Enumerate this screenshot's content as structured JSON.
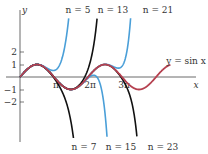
{
  "chart_data": {
    "type": "line",
    "title": "",
    "xlabel": "x",
    "ylabel": "y",
    "x_ticks": [
      {
        "value": 3.14159,
        "label": "π"
      },
      {
        "value": 6.28319,
        "label": "2π"
      },
      {
        "value": 9.42478,
        "label": "3π"
      }
    ],
    "y_ticks": [
      {
        "value": 2,
        "label": "2"
      },
      {
        "value": 1,
        "label": "1"
      },
      {
        "value": -1,
        "label": "−1"
      },
      {
        "value": -2,
        "label": "−2"
      }
    ],
    "xlim": [
      0,
      17
    ],
    "ylim": [
      -4.9,
      4.9
    ],
    "grid": false,
    "series": [
      {
        "name": "y = sin x",
        "kind": "sine",
        "color": "#b5404f",
        "x_range": [
          0,
          13.9
        ]
      },
      {
        "name": "n = 5",
        "kind": "taylor",
        "n": 5,
        "color": "#4a9fd8",
        "label_pos": "top"
      },
      {
        "name": "n = 7",
        "kind": "taylor",
        "n": 7,
        "color": "#111111",
        "label_pos": "bottom"
      },
      {
        "name": "n = 13",
        "kind": "taylor",
        "n": 13,
        "color": "#111111",
        "label_pos": "top"
      },
      {
        "name": "n = 15",
        "kind": "taylor",
        "n": 15,
        "color": "#4a9fd8",
        "label_pos": "bottom"
      },
      {
        "name": "n = 21",
        "kind": "taylor",
        "n": 21,
        "color": "#4a9fd8",
        "label_pos": "top"
      },
      {
        "name": "n = 23",
        "kind": "taylor",
        "n": 23,
        "color": "#111111",
        "label_pos": "bottom"
      }
    ],
    "annotations": [
      {
        "text": "n = 5",
        "x": 78,
        "y": 13
      },
      {
        "text": "n = 13",
        "x": 113,
        "y": 13
      },
      {
        "text": "n = 21",
        "x": 158,
        "y": 13
      },
      {
        "text": "n = 7",
        "x": 84,
        "y": 150
      },
      {
        "text": "n = 15",
        "x": 121,
        "y": 150
      },
      {
        "text": "n = 23",
        "x": 163,
        "y": 150
      },
      {
        "text": "y = sin x",
        "x": 186,
        "y": 64
      }
    ]
  }
}
